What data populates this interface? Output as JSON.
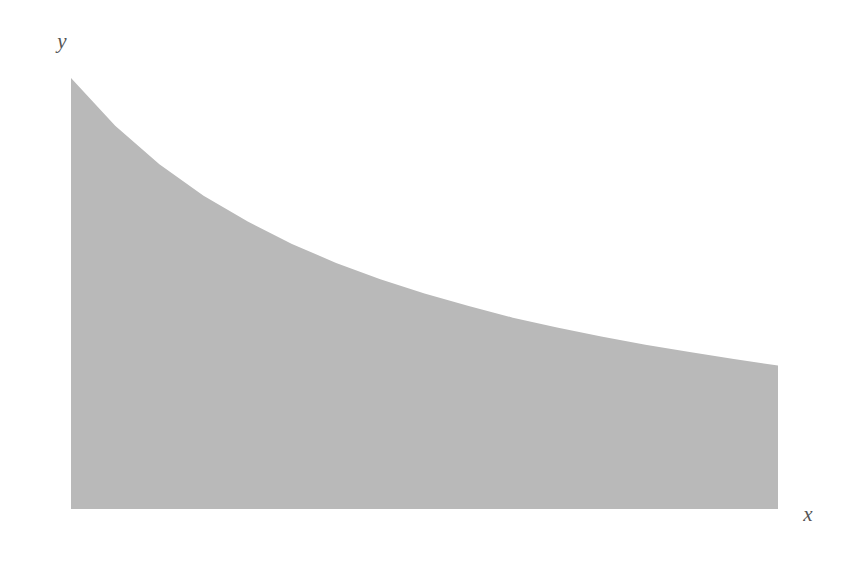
{
  "figure": {
    "title": "",
    "background_color": "#ffffff"
  },
  "axes": {
    "x_label": "x",
    "y_label": "y",
    "x_ticks": [
      {
        "value": 1,
        "label": "1"
      },
      {
        "value": 2,
        "label": "2"
      },
      {
        "value": 3,
        "label": "3"
      },
      {
        "value": 4,
        "label": "4"
      },
      {
        "value": 5,
        "label": "5"
      }
    ],
    "y_ticks": [
      {
        "value": 0.2,
        "label": "0.2"
      },
      {
        "value": 0.4,
        "label": "0.4"
      },
      {
        "value": 0.6,
        "label": "0.6"
      },
      {
        "value": 0.8,
        "label": "0.8"
      },
      {
        "value": 1.0,
        "label": "1.0"
      }
    ],
    "x_minor_tick_step": 0.2,
    "y_minor_tick_step": 0.05,
    "xlim": [
      1,
      5
    ],
    "ylim": [
      0,
      1.06
    ],
    "grid": false,
    "axis_color": "#7a7a7a"
  },
  "colors": {
    "curve": "#2b2b2b",
    "step_top": "#555555",
    "area_under_curve": "#b9b9b9",
    "area_above_curve": "#e9e9e9",
    "tick_text": "#666666",
    "axis_line": "#7a7a7a"
  },
  "chart_data": {
    "type": "area",
    "title": "",
    "xlabel": "x",
    "ylabel": "y",
    "xlim": [
      1,
      5
    ],
    "ylim": [
      0,
      1.06
    ],
    "grid": false,
    "legend": "none",
    "function": {
      "name": "f(x) = 2/(x+1)",
      "x": [
        1.0,
        1.25,
        1.5,
        1.75,
        2.0,
        2.25,
        2.5,
        2.75,
        3.0,
        3.25,
        3.5,
        3.75,
        4.0,
        4.25,
        4.5,
        4.75,
        5.0
      ],
      "y": [
        1.0,
        0.889,
        0.8,
        0.727,
        0.667,
        0.615,
        0.571,
        0.533,
        0.5,
        0.471,
        0.444,
        0.421,
        0.4,
        0.381,
        0.364,
        0.348,
        0.333
      ]
    },
    "riemann_rectangles": {
      "method": "left-endpoint",
      "count": 4,
      "width": 1,
      "x_left": [
        1,
        2,
        3,
        4
      ],
      "x_right": [
        2,
        3,
        4,
        5
      ],
      "heights": [
        1.0,
        0.667,
        0.5,
        0.4
      ]
    },
    "y_tick_values": [
      0.2,
      0.4,
      0.6,
      0.8,
      1.0
    ],
    "y_tick_labels": [
      "0.2",
      "0.4",
      "0.6",
      "0.8",
      "1.0"
    ],
    "x_tick_values": [
      1,
      2,
      3,
      4,
      5
    ],
    "x_tick_labels": [
      "1",
      "2",
      "3",
      "4",
      "5"
    ]
  }
}
